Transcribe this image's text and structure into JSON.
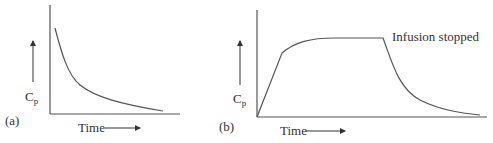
{
  "panels": [
    {
      "id": "a",
      "label": "(a)",
      "ylabel_main": "C",
      "ylabel_sub": "p",
      "xlabel": "Time",
      "description": "Concentration decays exponentially after bolus dose"
    },
    {
      "id": "b",
      "label": "(b)",
      "ylabel_main": "C",
      "ylabel_sub": "p",
      "xlabel": "Time",
      "annotation": "Infusion stopped",
      "description": "Concentration rises to plateau during infusion, then decays after infusion stopped"
    }
  ],
  "colors": {
    "line": "#555555",
    "text": "#333333",
    "background": "#ffffff"
  }
}
